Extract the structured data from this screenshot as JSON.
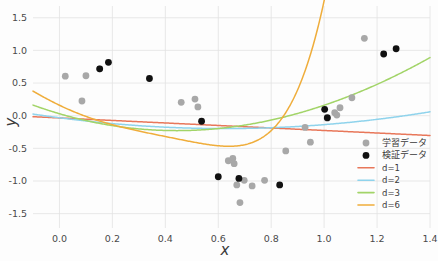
{
  "chart_data": {
    "type": "scatter",
    "title": "",
    "xlabel": "x",
    "ylabel": "y",
    "xlim": [
      -0.1,
      1.4
    ],
    "ylim": [
      -1.72,
      1.68
    ],
    "grid": true,
    "legend_position": "lower-right",
    "xticks": [
      "0.0",
      "0.2",
      "0.4",
      "0.6",
      "0.8",
      "1.0",
      "1.2",
      "1.4"
    ],
    "xtick_values": [
      0.0,
      0.2,
      0.4,
      0.6,
      0.8,
      1.0,
      1.2,
      1.4
    ],
    "yticks": [
      "1.5",
      "1.0",
      "0.5",
      "0.0",
      "-0.5",
      "-1.0",
      "-1.5"
    ],
    "ytick_values": [
      1.5,
      1.0,
      0.5,
      0.0,
      -0.5,
      -1.0,
      -1.5
    ],
    "series": [
      {
        "name": "学習データ",
        "type": "scatter",
        "marker": "circle",
        "color": "#a8a8a8",
        "points": [
          [
            0.022,
            0.605
          ],
          [
            0.085,
            0.225
          ],
          [
            0.1,
            0.612
          ],
          [
            0.152,
            0.718
          ],
          [
            0.46,
            0.205
          ],
          [
            0.512,
            0.255
          ],
          [
            0.523,
            0.135
          ],
          [
            0.638,
            -0.69
          ],
          [
            0.655,
            -0.655
          ],
          [
            0.66,
            -0.735
          ],
          [
            0.67,
            -1.06
          ],
          [
            0.682,
            -1.33
          ],
          [
            0.698,
            -0.99
          ],
          [
            0.728,
            -1.075
          ],
          [
            0.775,
            -0.99
          ],
          [
            0.855,
            -0.54
          ],
          [
            0.928,
            -0.18
          ],
          [
            0.948,
            -0.405
          ],
          [
            1.012,
            -0.04
          ],
          [
            1.04,
            0.045
          ],
          [
            1.048,
            0.01
          ],
          [
            1.06,
            0.122
          ],
          [
            1.105,
            0.275
          ],
          [
            1.152,
            1.185
          ]
        ]
      },
      {
        "name": "検証データ",
        "type": "scatter",
        "marker": "circle",
        "color": "#111111",
        "points": [
          [
            0.152,
            0.718
          ],
          [
            0.185,
            0.818
          ],
          [
            0.34,
            0.57
          ],
          [
            0.537,
            -0.085
          ],
          [
            0.6,
            -0.935
          ],
          [
            0.678,
            -0.96
          ],
          [
            0.832,
            -1.06
          ],
          [
            1.002,
            0.098
          ],
          [
            1.012,
            -0.03
          ],
          [
            1.225,
            0.945
          ],
          [
            1.272,
            1.025
          ]
        ]
      },
      {
        "name": "d=1",
        "type": "line",
        "degree": 1,
        "color": "#e8775a",
        "coeffs": [
          -0.0345,
          -0.192
        ],
        "comment": "y = -0.0345 - 0.192*x  (fitted straight line)"
      },
      {
        "name": "d=2",
        "type": "line",
        "degree": 2,
        "color": "#8fd3ec",
        "coeffs": [
          -0.032,
          -0.53,
          0.425
        ],
        "comment": "y = -0.032 - 0.530*x + 0.425*x^2"
      },
      {
        "name": "d=3",
        "type": "line",
        "degree": 3,
        "color": "#a2d468",
        "coeffs": [
          0.03,
          -1.185,
          1.39,
          -0.075
        ],
        "comment": "cubic fit"
      },
      {
        "name": "d=6",
        "type": "line",
        "degree": 6,
        "color": "#efad3b",
        "coeffs": [
          0.16,
          -1.95,
          2.35,
          1.2,
          -8.2,
          4.0,
          4.2
        ],
        "comment": "degree-6 polynomial fit, steep rise past x=1.05"
      }
    ]
  },
  "axes": {
    "x_title": "x",
    "y_title": "y"
  },
  "legend": {
    "items": [
      {
        "label": "学習データ",
        "kind": "marker",
        "color": "#a8a8a8"
      },
      {
        "label": "検証データ",
        "kind": "marker",
        "color": "#111111"
      },
      {
        "label": "d=1",
        "kind": "line",
        "color": "#e8775a"
      },
      {
        "label": "d=2",
        "kind": "line",
        "color": "#8fd3ec"
      },
      {
        "label": "d=3",
        "kind": "line",
        "color": "#a2d468"
      },
      {
        "label": "d=6",
        "kind": "line",
        "color": "#efad3b"
      }
    ]
  },
  "style": {
    "background": "#fdfdfd",
    "grid_color": "#e2e2e2",
    "text_color": "#3a3a3a"
  }
}
